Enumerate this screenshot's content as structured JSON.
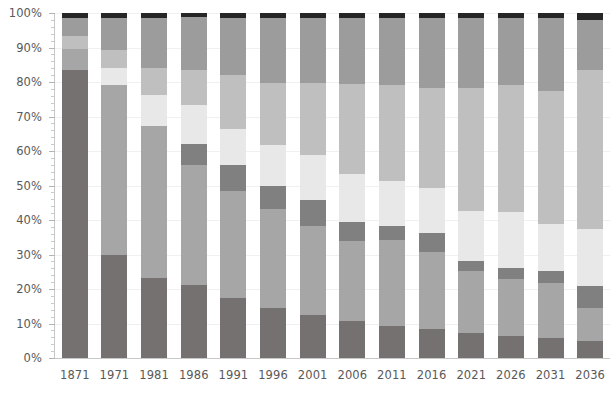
{
  "chart_data": {
    "type": "bar",
    "title": "",
    "subtitle": "",
    "xlabel": "",
    "ylabel": "",
    "stacked": true,
    "normalized": true,
    "grid": true,
    "legend_position": "none",
    "ylim": [
      0,
      100
    ],
    "ytick_labels": [
      "0%",
      "10%",
      "20%",
      "30%",
      "40%",
      "50%",
      "60%",
      "70%",
      "80%",
      "90%",
      "100%"
    ],
    "ytick_values": [
      0,
      10,
      20,
      30,
      40,
      50,
      60,
      70,
      80,
      90,
      100
    ],
    "minor_ticks_per_major": 5,
    "categories": [
      "1871",
      "1971",
      "1981",
      "1986",
      "1991",
      "1996",
      "2001",
      "2006",
      "2011",
      "2016",
      "2021",
      "2026",
      "2031",
      "2036"
    ],
    "series": [
      {
        "name": "series-1",
        "color": "#767171",
        "values": [
          83.5,
          29.8,
          23.2,
          21.2,
          17.5,
          14.5,
          12.5,
          10.8,
          9.2,
          8.3,
          7.2,
          6.3,
          5.8,
          5.0
        ]
      },
      {
        "name": "series-2",
        "color": "#a6a6a6",
        "values": [
          6.0,
          49.3,
          44.0,
          34.7,
          30.8,
          28.8,
          25.8,
          23.0,
          25.0,
          22.5,
          18.0,
          16.7,
          16.0,
          9.5
        ]
      },
      {
        "name": "series-3",
        "color": "#808080",
        "values": [
          0.0,
          0.0,
          0.0,
          6.0,
          7.5,
          6.5,
          7.5,
          5.5,
          4.0,
          5.5,
          3.0,
          3.2,
          3.5,
          6.5
        ]
      },
      {
        "name": "series-4",
        "color": "#e8e8e8",
        "values": [
          0.0,
          5.0,
          9.0,
          11.5,
          10.5,
          12.0,
          13.0,
          14.0,
          13.0,
          13.0,
          14.5,
          16.0,
          13.5,
          16.5
        ]
      },
      {
        "name": "series-5",
        "color": "#bfbfbf",
        "values": [
          3.7,
          5.3,
          7.8,
          10.2,
          15.8,
          18.0,
          21.0,
          26.0,
          28.0,
          29.0,
          35.5,
          37.0,
          38.5,
          46.0
        ]
      },
      {
        "name": "series-6",
        "color": "#9c9c9c",
        "values": [
          5.3,
          9.1,
          14.5,
          15.2,
          16.5,
          18.7,
          18.7,
          19.2,
          19.3,
          20.2,
          20.3,
          19.3,
          21.2,
          14.5
        ]
      },
      {
        "name": "series-7",
        "color": "#262626",
        "values": [
          1.5,
          1.5,
          1.5,
          1.2,
          1.4,
          1.5,
          1.5,
          1.5,
          1.5,
          1.5,
          1.5,
          1.5,
          1.5,
          2.0
        ]
      }
    ]
  },
  "axes": {
    "y_axis_name": "percentage-axis",
    "x_axis_name": "year-axis"
  }
}
